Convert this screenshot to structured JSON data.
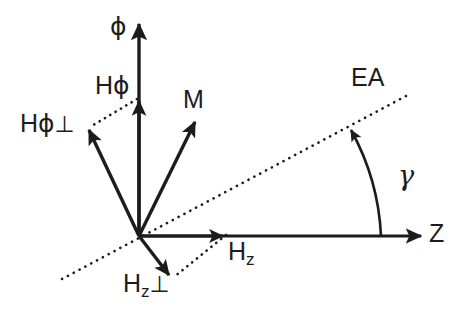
{
  "figure": {
    "background_color": "#ffffff",
    "stroke_color": "#1c1c1c",
    "width": 466,
    "height": 319,
    "origin": {
      "x": 139,
      "y": 236
    }
  },
  "axes": [
    {
      "id": "phi-axis",
      "label": "ϕ",
      "label_x": 110,
      "label_y": 18,
      "direction": "vertical-up",
      "tip": {
        "x": 139,
        "y": 20
      },
      "style": "solid-arrow"
    },
    {
      "id": "z-axis",
      "label": "Z",
      "label_x": 429,
      "label_y": 222,
      "direction": "horizontal-right",
      "tip": {
        "x": 425,
        "y": 236
      },
      "style": "solid-arrow"
    }
  ],
  "vectors": [
    {
      "id": "h-phi",
      "label_head": "H",
      "label_sub": "ϕ",
      "label_perp": "",
      "label_x": 95,
      "label_y": 74,
      "tip": {
        "x": 139,
        "y": 98
      },
      "style": "solid-arrow"
    },
    {
      "id": "h-phi-perp",
      "label_head": "H",
      "label_sub": "ϕ",
      "label_perp": "⊥",
      "label_x": 20,
      "label_y": 112,
      "tip": {
        "x": 87,
        "y": 128
      },
      "style": "solid-arrow"
    },
    {
      "id": "magnetization",
      "label_head": "M",
      "label_sub": "",
      "label_perp": "",
      "label_x": 183,
      "label_y": 88,
      "tip": {
        "x": 197,
        "y": 119
      },
      "style": "solid-arrow"
    },
    {
      "id": "h-z",
      "label_head": "H",
      "label_sub": "z",
      "label_perp": "",
      "label_x": 228,
      "label_y": 240,
      "tip": {
        "x": 227,
        "y": 236
      },
      "style": "solid-arrow"
    },
    {
      "id": "h-z-perp",
      "label_head": "H",
      "label_sub": "z",
      "label_perp": "⊥",
      "label_x": 123,
      "label_y": 272,
      "tip": {
        "x": 172,
        "y": 279
      },
      "style": "solid-arrow"
    }
  ],
  "dotted_lines": [
    {
      "id": "easy-axis-line",
      "label": "EA",
      "label_x": 351,
      "label_y": 66,
      "from": {
        "x": 62,
        "y": 279
      },
      "to": {
        "x": 406,
        "y": 96
      },
      "style": "dotted"
    },
    {
      "id": "h-phi-projection",
      "from": {
        "x": 139,
        "y": 98
      },
      "to": {
        "x": 87,
        "y": 128
      },
      "style": "dotted"
    },
    {
      "id": "h-z-projection",
      "from": {
        "x": 227,
        "y": 236
      },
      "to": {
        "x": 172,
        "y": 279
      },
      "style": "dotted"
    }
  ],
  "angles": [
    {
      "id": "gamma-angle",
      "label": "γ",
      "label_x": 398,
      "label_y": 165,
      "between": [
        "z-axis",
        "easy-axis-line"
      ],
      "vertex": {
        "x": 139,
        "y": 236
      },
      "arc_start": {
        "x": 380,
        "y": 236
      },
      "arc_end": {
        "x": 347,
        "y": 128
      },
      "value_degrees": 28
    }
  ]
}
